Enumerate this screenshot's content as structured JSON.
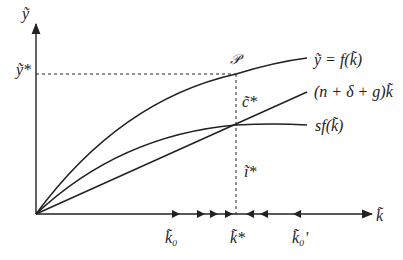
{
  "diagram": {
    "axes": {
      "y_label": "ỹ",
      "x_label": "k̃"
    },
    "curves": {
      "output": "ỹ = f(k̃)",
      "break_even": "(n + δ + g)k̃",
      "investment": "sf(k̃)"
    },
    "points": {
      "P": "𝒫",
      "y_star": "ỹ*",
      "c_star": "c̃*",
      "i_star": "ĩ*",
      "k_star": "k̃*",
      "k0": "k̃₀",
      "k0_prime": "k̃₀'"
    },
    "colors": {
      "line": "#222222"
    }
  }
}
